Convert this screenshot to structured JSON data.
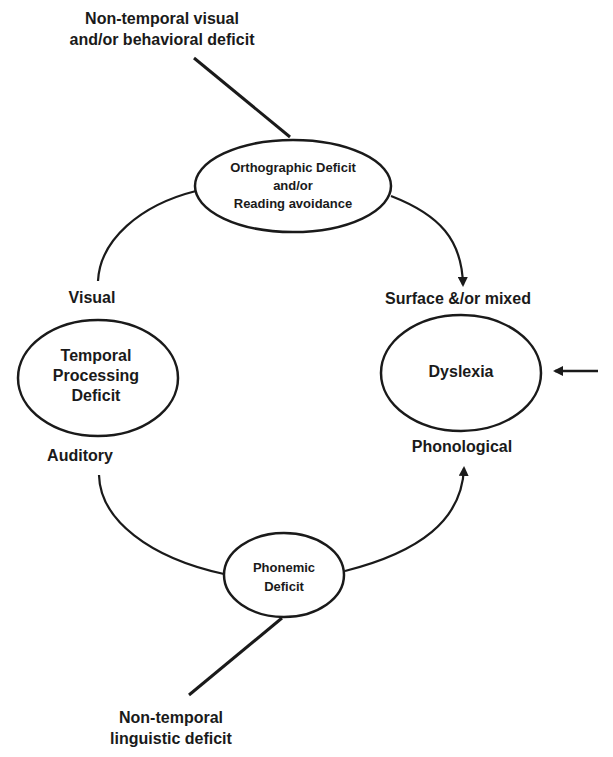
{
  "diagram": {
    "top_input_label": [
      "Non-temporal visual",
      "and/or behavioral deficit"
    ],
    "bottom_input_label": [
      "Non-temporal",
      "linguistic deficit"
    ],
    "nodes": {
      "orthographic": [
        "Orthographic Deficit",
        "and/or",
        "Reading avoidance"
      ],
      "temporal": [
        "Temporal",
        "Processing",
        "Deficit"
      ],
      "dyslexia": [
        "Dyslexia"
      ],
      "phonemic": [
        "Phonemic",
        "Deficit"
      ]
    },
    "edge_labels": {
      "visual": "Visual",
      "auditory": "Auditory",
      "surface": "Surface &/or mixed",
      "phonological": "Phonological"
    },
    "edges": [
      {
        "from": "Non-temporal visual and/or behavioral deficit",
        "to": "Orthographic Deficit and/or Reading avoidance",
        "type": "line"
      },
      {
        "from": "Temporal Processing Deficit (Visual)",
        "to": "Orthographic Deficit and/or Reading avoidance",
        "type": "curve"
      },
      {
        "from": "Orthographic Deficit and/or Reading avoidance",
        "to": "Dyslexia (Surface &/or mixed)",
        "type": "arrow"
      },
      {
        "from": "Temporal Processing Deficit (Auditory)",
        "to": "Phonemic Deficit",
        "type": "curve"
      },
      {
        "from": "Phonemic Deficit",
        "to": "Dyslexia (Phonological)",
        "type": "arrow"
      },
      {
        "from": "Non-temporal linguistic deficit",
        "to": "Phonemic Deficit",
        "type": "line"
      },
      {
        "from": "external",
        "to": "Dyslexia",
        "type": "arrow"
      }
    ]
  }
}
